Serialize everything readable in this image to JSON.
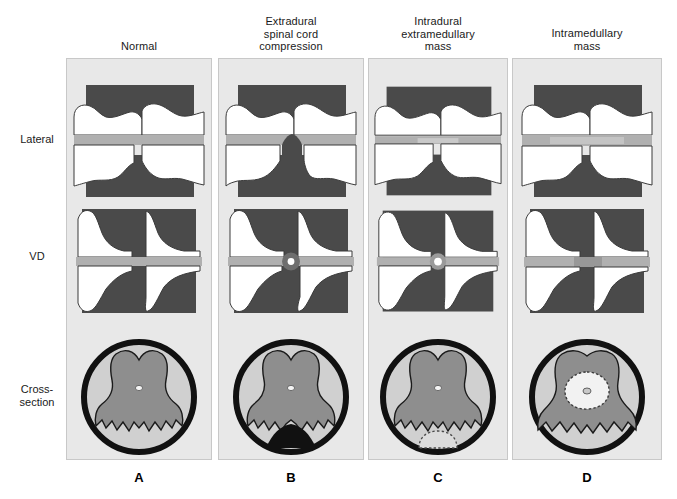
{
  "figure": {
    "row_labels": [
      {
        "id": "lateral",
        "label": "Lateral"
      },
      {
        "id": "vd",
        "label": "VD"
      },
      {
        "id": "cross-section",
        "label": "Cross-\nsection"
      }
    ],
    "columns": [
      {
        "letter": "A",
        "header": "Normal",
        "header_lines": [
          "Normal"
        ],
        "lesion_type": "normal",
        "description": "Normal myelogram: contrast columns are uniform and uninterrupted in all views.",
        "lateral": {
          "cord_band": "uniform",
          "mass": "none"
        },
        "vd": {
          "cord_band": "uniform",
          "mass": "none"
        },
        "cross_section": {
          "mass": "none",
          "cord_shape": "normal-butterfly",
          "central_canal": "visible"
        }
      },
      {
        "letter": "B",
        "header": "Extradural\nspinal cord\ncompression",
        "header_lines": [
          "Extradural",
          "spinal cord",
          "compression"
        ],
        "lesion_type": "extradural",
        "description": "Extradural mass deviates and thins the contrast column from outside the dura; cord deviated away from lesion.",
        "lateral": {
          "cord_band": "deviated-dorsally",
          "mass": "ventral-extradural"
        },
        "vd": {
          "cord_band": "narrowed-centrally",
          "mass": "central-ring"
        },
        "cross_section": {
          "mass": "ventral-black-extradural",
          "cord_shape": "indented-ventrally",
          "central_canal": "visible"
        }
      },
      {
        "letter": "C",
        "header": "Intradural\nextramedullary\nmass",
        "header_lines": [
          "Intradural",
          "extramedullary",
          "mass"
        ],
        "lesion_type": "intradural-extramedullary",
        "description": "Intradural extramedullary mass produces a golf-tee sign: contrast column splays around the mass within the dura.",
        "lateral": {
          "cord_band": "thin-uniform",
          "mass": "intradural-ventral"
        },
        "vd": {
          "cord_band": "uniform-with-focus",
          "mass": "central-dot"
        },
        "cross_section": {
          "mass": "ventral-dotted-intradural",
          "cord_shape": "normal-butterfly",
          "central_canal": "visible"
        }
      },
      {
        "letter": "D",
        "header": "Intramedullary\nmass",
        "header_lines": [
          "Intramedullary",
          "mass"
        ],
        "lesion_type": "intramedullary",
        "description": "Intramedullary mass expands the cord, thinning the contrast columns on both sides in all projections.",
        "lateral": {
          "cord_band": "widened",
          "mass": "within-cord"
        },
        "vd": {
          "cord_band": "widened-centrally",
          "mass": "within-cord"
        },
        "cross_section": {
          "mass": "central-dotted-intramedullary",
          "cord_shape": "expanded",
          "central_canal": "visible"
        }
      }
    ],
    "colors": {
      "panel_background": "#e8e8e8",
      "panel_border": "#c8c8c8",
      "bone_dark": "#4a4a4a",
      "vertebra_white": "#ffffff",
      "contrast_gray": "#b0b0b0",
      "dura_black": "#111111",
      "subarachnoid_gray": "#d0d0d0",
      "cord_gray": "#8e8e8e",
      "mass_black": "#1a1a1a",
      "text": "#1a1a1a"
    }
  }
}
